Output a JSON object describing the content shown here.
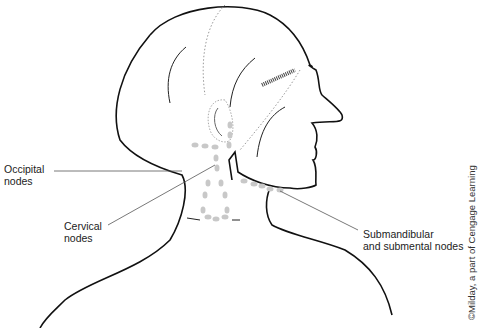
{
  "diagram": {
    "labels": {
      "occipital": [
        "Occipital",
        "nodes"
      ],
      "cervical": [
        "Cervical",
        "nodes"
      ],
      "submandibular": [
        "Submandibular",
        "and submental nodes"
      ]
    },
    "credit": "©Milday, a part of Cengage Learning",
    "colors": {
      "outline": "#111111",
      "nodes": "#c8c8c8",
      "leader": "#555555",
      "dotted": "#999999"
    }
  }
}
